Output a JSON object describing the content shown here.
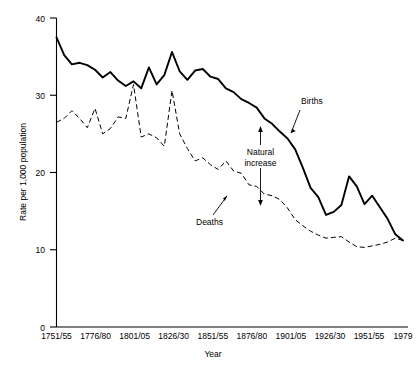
{
  "chart_data": {
    "type": "line",
    "title": "",
    "xlabel": "Year",
    "ylabel": "Rate per 1,000 population",
    "xlim": [
      0,
      45
    ],
    "ylim": [
      0,
      40
    ],
    "grid": false,
    "legend_position": "inline-annotations",
    "y_ticks": [
      "0",
      "10",
      "20",
      "30",
      "40"
    ],
    "y_tick_values": [
      0,
      10,
      20,
      30,
      40
    ],
    "x_ticks": [
      "1751/55",
      "1776/80",
      "1801/05",
      "1826/30",
      "1851/55",
      "1876/80",
      "1901/05",
      "1926/30",
      "1951/55",
      "1979"
    ],
    "x_tick_values": [
      0,
      5,
      10,
      15,
      20,
      25,
      30,
      35,
      40,
      45
    ],
    "categories": [
      "1751/55",
      "1756/60",
      "1761/65",
      "1766/70",
      "1771/75",
      "1776/80",
      "1781/85",
      "1786/90",
      "1791/95",
      "1796/1800",
      "1801/05",
      "1806/10",
      "1811/15",
      "1816/20",
      "1821/25",
      "1826/30",
      "1831/35",
      "1836/40",
      "1841/45",
      "1846/50",
      "1851/55",
      "1856/60",
      "1861/65",
      "1866/70",
      "1871/75",
      "1876/80",
      "1881/85",
      "1886/90",
      "1891/95",
      "1896/1900",
      "1901/05",
      "1906/10",
      "1911/15",
      "1916/20",
      "1921/25",
      "1926/30",
      "1931/35",
      "1936/40",
      "1941/45",
      "1946/50",
      "1951/55",
      "1956/60",
      "1961/65",
      "1966/70",
      "1971/75",
      "1979"
    ],
    "series": [
      {
        "name": "Births",
        "style": "solid",
        "values": [
          37.5,
          35.2,
          34.0,
          34.2,
          33.9,
          33.3,
          32.3,
          33.0,
          31.9,
          31.2,
          31.8,
          30.9,
          33.6,
          31.4,
          32.6,
          35.6,
          33.1,
          32.0,
          33.2,
          33.4,
          32.4,
          32.1,
          30.9,
          30.4,
          29.5,
          29.0,
          28.4,
          27.0,
          26.3,
          25.3,
          24.4,
          23.0,
          20.6,
          18.0,
          16.8,
          14.5,
          14.9,
          15.8,
          19.5,
          18.2,
          15.9,
          17.0,
          15.5,
          14.0,
          12.0,
          11.2
        ],
        "color": "#000000"
      },
      {
        "name": "Deaths",
        "style": "dashed",
        "values": [
          26.5,
          27.0,
          28.0,
          27.0,
          25.8,
          28.3,
          25.0,
          25.7,
          27.2,
          27.0,
          31.4,
          24.6,
          25.0,
          24.5,
          23.4,
          30.6,
          25.0,
          23.1,
          21.5,
          21.9,
          21.0,
          20.4,
          21.5,
          20.2,
          19.9,
          18.4,
          18.2,
          17.2,
          17.0,
          16.5,
          15.4,
          13.9,
          13.1,
          12.4,
          11.9,
          11.5,
          11.6,
          11.7,
          11.0,
          10.4,
          10.3,
          10.5,
          10.7,
          11.0,
          11.5,
          11.2
        ],
        "color": "#000000"
      }
    ],
    "annotations": [
      {
        "id": "births-annotation",
        "text": "Births"
      },
      {
        "id": "deaths-annotation",
        "text": "Deaths"
      },
      {
        "id": "natural-increase-annotation",
        "text": "Natural",
        "text2": "increase"
      }
    ]
  }
}
